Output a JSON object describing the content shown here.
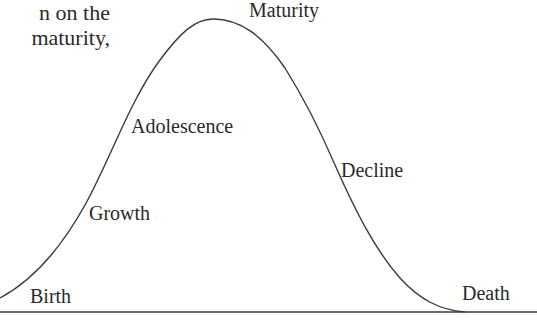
{
  "intro_text": {
    "line1": "n on the",
    "line2": "maturity,"
  },
  "stages": [
    {
      "label": "Birth",
      "x": 30,
      "y": 285
    },
    {
      "label": "Growth",
      "x": 89,
      "y": 202
    },
    {
      "label": "Adolescence",
      "x": 131,
      "y": 115
    },
    {
      "label": "Maturity",
      "x": 249,
      "y": -3
    },
    {
      "label": "Decline",
      "x": 341,
      "y": 159
    },
    {
      "label": "Death",
      "x": 462,
      "y": 282
    }
  ],
  "curve": {
    "stroke": "#3a3a3a",
    "baseline_y": 312,
    "peak": {
      "x": 213,
      "y": 19
    }
  }
}
